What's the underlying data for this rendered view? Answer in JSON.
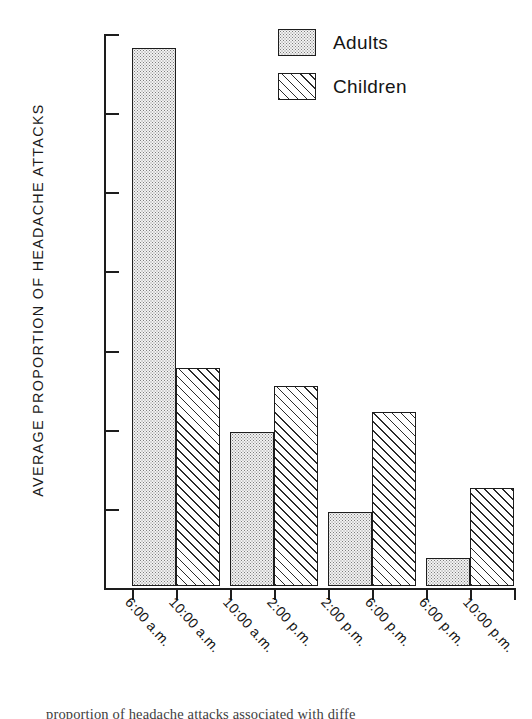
{
  "chart_data": {
    "type": "bar",
    "title": "",
    "xlabel": "",
    "ylabel": "AVERAGE PROPORTION OF HEADACHE ATTACKS",
    "ylim": [
      0.0,
      0.7
    ],
    "ytick_labels": [
      "0.0",
      "0.1",
      "0.2",
      "0.3",
      "0.4",
      "0.5",
      "0.6",
      "0.7"
    ],
    "ytick_values": [
      0.0,
      0.1,
      0.2,
      0.3,
      0.4,
      0.5,
      0.6,
      0.7
    ],
    "grid": false,
    "legend_position": "top-right",
    "categories": [
      "6:00 a.m. - 10:00 a.m.",
      "10:00 a.m. - 2:00 p.m.",
      "2:00 p.m. - 6:00 p.m.",
      "6:00 p.m. - 10:00 p.m."
    ],
    "category_label_lines": [
      [
        "6:00 a.m.",
        "10:00 a.m."
      ],
      [
        "10:00 a.m.",
        "2:00 p.m."
      ],
      [
        "2:00 p.m.",
        "6:00 p.m."
      ],
      [
        "6:00 p.m.",
        "10:00 p.m."
      ]
    ],
    "series": [
      {
        "name": "Adults",
        "fill": "dotted",
        "values": [
          0.68,
          0.194,
          0.093,
          0.035
        ]
      },
      {
        "name": "Children",
        "fill": "hatched",
        "values": [
          0.275,
          0.253,
          0.22,
          0.124
        ]
      }
    ]
  },
  "legend": {
    "items": [
      {
        "label": "Adults",
        "pattern": "dotted"
      },
      {
        "label": "Children",
        "pattern": "hatched"
      }
    ]
  },
  "caption": {
    "text": "proportion of headache attacks associated with diffe"
  },
  "colors": {
    "ink": "#1d1d1d",
    "background": "#ffffff",
    "adults_fill": "#f2f2f2",
    "children_fill": "#ffffff"
  }
}
